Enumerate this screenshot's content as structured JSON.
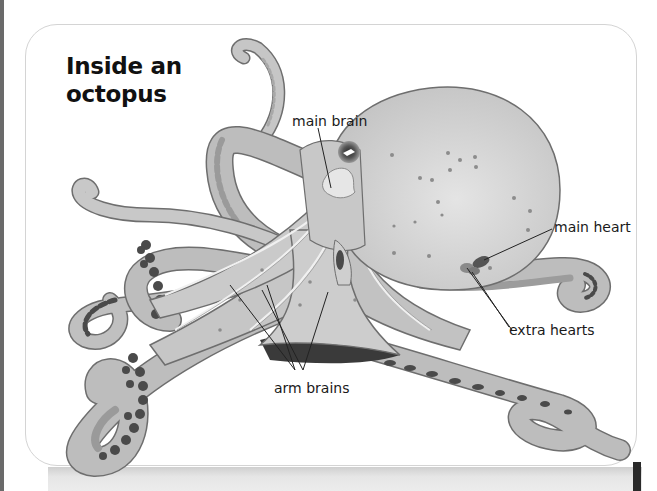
{
  "page": {
    "title_line1": "Inside an",
    "title_line2": "octopus"
  },
  "diagram": {
    "subject": "octopus",
    "colors": {
      "body_fill": "#c9c9c9",
      "body_light": "#dcdcdc",
      "arm_fill": "#bdbdbd",
      "arm_underside": "#9c9c9c",
      "sucker_dark": "#4a4a4a",
      "outline": "#6e6e6e",
      "pointer_line": "#222222",
      "organ_dark": "#555555"
    },
    "labels": [
      {
        "id": "main-brain",
        "text": "main brain"
      },
      {
        "id": "main-heart",
        "text": "main heart"
      },
      {
        "id": "extra-hearts",
        "text": "extra hearts"
      },
      {
        "id": "arm-brains",
        "text": "arm brains"
      }
    ]
  }
}
